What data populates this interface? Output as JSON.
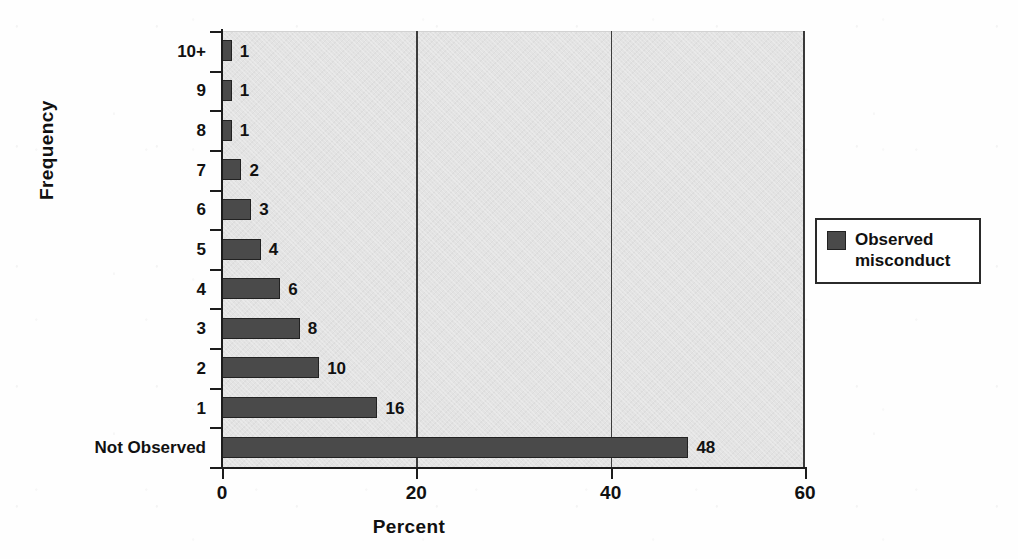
{
  "chart_data": {
    "type": "bar",
    "orientation": "horizontal",
    "title": "",
    "xlabel": "Percent",
    "ylabel": "Frequency",
    "xlim": [
      0,
      60
    ],
    "xticks": [
      0,
      20,
      40,
      60
    ],
    "xtick_labels": [
      "0",
      "20",
      "40",
      "60"
    ],
    "gridlines": [
      20,
      40
    ],
    "grid": true,
    "legend_position": "right",
    "categories": [
      "10+",
      "9",
      "8",
      "7",
      "6",
      "5",
      "4",
      "3",
      "2",
      "1",
      "Not Observed"
    ],
    "values": [
      1,
      1,
      1,
      2,
      3,
      4,
      6,
      8,
      10,
      16,
      48
    ],
    "data_labels": [
      "1",
      "1",
      "1",
      "2",
      "3",
      "4",
      "6",
      "8",
      "10",
      "16",
      "48"
    ],
    "series": [
      {
        "name": "Observed misconduct",
        "color": "#4a4a4a",
        "values": [
          1,
          1,
          1,
          2,
          3,
          4,
          6,
          8,
          10,
          16,
          48
        ]
      }
    ]
  },
  "legend": {
    "entries": [
      {
        "label_line1": "Observed",
        "label_line2": "misconduct",
        "color": "#4a4a4a"
      }
    ]
  },
  "colors": {
    "bar_fill": "#4a4a4a",
    "bar_outline": "#222222",
    "plot_background": "#e3e3e3",
    "axis": "#1c1c1c",
    "gridline": "#3c3c3c",
    "text": "#111111",
    "page_background": "#ffffff"
  }
}
